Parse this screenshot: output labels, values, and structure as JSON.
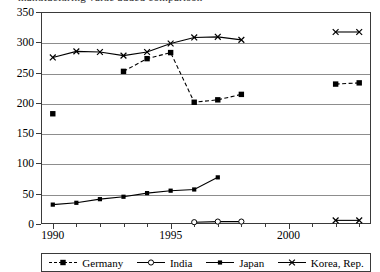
{
  "title_fragment": "manufacturing value added comparison",
  "axes": {
    "y_ticks": [
      0,
      50,
      100,
      150,
      200,
      250,
      300,
      350
    ],
    "x_labels": [
      {
        "year": 1990,
        "text": "1990"
      },
      {
        "year": 1995,
        "text": "1995"
      },
      {
        "year": 2000,
        "text": "2000"
      }
    ]
  },
  "legend": {
    "items": [
      {
        "label": "Germany",
        "marker": "square",
        "dash": "dashed"
      },
      {
        "label": "India",
        "marker": "circle-open",
        "dash": "solid"
      },
      {
        "label": "Japan",
        "marker": "square-small",
        "dash": "solid"
      },
      {
        "label": "Korea, Rep.",
        "marker": "cross",
        "dash": "solid"
      }
    ]
  },
  "chart_data": {
    "type": "line",
    "title": "",
    "xlabel": "",
    "ylabel": "",
    "xlim": [
      1989.5,
      2003.5
    ],
    "ylim": [
      0,
      350
    ],
    "grid": true,
    "legend_position": "bottom",
    "x": [
      1990,
      1991,
      1992,
      1993,
      1994,
      1995,
      1996,
      1997,
      1998,
      1999,
      2000,
      2001,
      2002,
      2003
    ],
    "series": [
      {
        "name": "Germany",
        "marker": "square",
        "dash": "dashed",
        "color": "#000000",
        "points": [
          {
            "x": 1990,
            "y": 182
          },
          {
            "x": 1993,
            "y": 252
          },
          {
            "x": 1994,
            "y": 273
          },
          {
            "x": 1995,
            "y": 283
          },
          {
            "x": 1996,
            "y": 201
          },
          {
            "x": 1997,
            "y": 205
          },
          {
            "x": 1998,
            "y": 214
          },
          {
            "x": 2002,
            "y": 231
          },
          {
            "x": 2003,
            "y": 233
          }
        ],
        "segments": [
          [
            1993,
            1994,
            1995,
            1996,
            1997,
            1998
          ],
          [
            2002,
            2003
          ]
        ]
      },
      {
        "name": "India",
        "marker": "circle-open",
        "dash": "solid",
        "color": "#000000",
        "points": [
          {
            "x": 1996,
            "y": 3
          },
          {
            "x": 1997,
            "y": 4
          },
          {
            "x": 1998,
            "y": 4
          }
        ],
        "segments": [
          [
            1996,
            1997,
            1998
          ]
        ]
      },
      {
        "name": "Japan",
        "marker": "square-small",
        "dash": "solid",
        "color": "#000000",
        "points": [
          {
            "x": 1990,
            "y": 32
          },
          {
            "x": 1991,
            "y": 35
          },
          {
            "x": 1992,
            "y": 41
          },
          {
            "x": 1993,
            "y": 45
          },
          {
            "x": 1994,
            "y": 51
          },
          {
            "x": 1995,
            "y": 55
          },
          {
            "x": 1996,
            "y": 57
          },
          {
            "x": 1997,
            "y": 77
          }
        ],
        "segments": [
          [
            1990,
            1991,
            1992,
            1993,
            1994,
            1995,
            1996,
            1997
          ]
        ]
      },
      {
        "name": "Korea, Rep.",
        "marker": "cross",
        "dash": "solid",
        "color": "#000000",
        "points": [
          {
            "x": 1990,
            "y": 275
          },
          {
            "x": 1991,
            "y": 285
          },
          {
            "x": 1992,
            "y": 284
          },
          {
            "x": 1993,
            "y": 278
          },
          {
            "x": 1994,
            "y": 284
          },
          {
            "x": 1995,
            "y": 298
          },
          {
            "x": 1996,
            "y": 308
          },
          {
            "x": 1997,
            "y": 309
          },
          {
            "x": 1998,
            "y": 304
          },
          {
            "x": 2002,
            "y": 317
          },
          {
            "x": 2003,
            "y": 317
          }
        ],
        "segments": [
          [
            1990,
            1991,
            1992,
            1993,
            1994,
            1995,
            1996,
            1997,
            1998
          ],
          [
            2002,
            2003
          ]
        ]
      },
      {
        "name": "Korea, Rep. low",
        "marker": "cross",
        "dash": "solid",
        "color": "#000000",
        "points": [
          {
            "x": 2002,
            "y": 6
          },
          {
            "x": 2003,
            "y": 6
          }
        ],
        "segments": [
          [
            2002,
            2003
          ]
        ]
      }
    ]
  }
}
